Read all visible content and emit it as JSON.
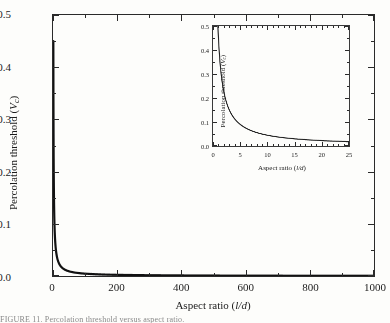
{
  "figure": {
    "caption": "FIGURE 11. Percolation threshold versus aspect ratio."
  },
  "main": {
    "xlabel_prefix": "Aspect ratio (",
    "xlabel_italic": "l/d",
    "xlabel_suffix": ")",
    "ylabel_prefix": "Percolation threshold (",
    "ylabel_italic": "V",
    "ylabel_sub": "c",
    "ylabel_suffix": ")",
    "xticks": [
      "0",
      "200",
      "400",
      "600",
      "800",
      "1000"
    ],
    "yticks": [
      "0.0",
      "0.1",
      "0.2",
      "0.3",
      "0.4",
      "0.5"
    ]
  },
  "inset": {
    "xlabel_prefix": "Aspect ratio (",
    "xlabel_italic": "l/d",
    "xlabel_suffix": ")",
    "ylabel_prefix": "Percolation threshold (",
    "ylabel_italic": "V",
    "ylabel_sub": "c",
    "ylabel_suffix": ")",
    "xticks": [
      "0",
      "5",
      "10",
      "15",
      "20",
      "25"
    ],
    "yticks": [
      "0.0",
      "0.1",
      "0.2",
      "0.3",
      "0.4",
      "0.5"
    ]
  },
  "chart_data": [
    {
      "id": "main",
      "type": "line",
      "title": "",
      "xlabel": "Aspect ratio (l/d)",
      "ylabel": "Percolation threshold (Vc)",
      "xlim": [
        0,
        1000
      ],
      "ylim": [
        0.0,
        0.5
      ],
      "xtick_values": [
        0,
        200,
        400,
        600,
        800,
        1000
      ],
      "ytick_values": [
        0.0,
        0.1,
        0.2,
        0.3,
        0.4,
        0.5
      ],
      "minor_ticks": true,
      "grid": false,
      "legend": "none",
      "line_color": "#111111",
      "line_width": 2.2,
      "series": [
        {
          "name": "Percolation threshold",
          "x": [
            0.8,
            1,
            1.5,
            2,
            2.5,
            3,
            4,
            5,
            6,
            8,
            10,
            12,
            15,
            20,
            25,
            30,
            40,
            50,
            60,
            80,
            100,
            150,
            200,
            300,
            400,
            500,
            600,
            700,
            800,
            900,
            1000
          ],
          "y": [
            0.5,
            0.45,
            0.31,
            0.235,
            0.19,
            0.159,
            0.12,
            0.097,
            0.081,
            0.061,
            0.049,
            0.041,
            0.033,
            0.0249,
            0.02,
            0.0167,
            0.0125,
            0.01,
            0.0084,
            0.0063,
            0.005,
            0.0033,
            0.0025,
            0.0017,
            0.00125,
            0.001,
            0.00084,
            0.00072,
            0.00063,
            0.00056,
            0.0005
          ]
        }
      ]
    },
    {
      "id": "inset",
      "type": "line",
      "title": "",
      "xlabel": "Aspect ratio (l/d)",
      "ylabel": "Percolation threshold (Vc)",
      "xlim": [
        0,
        25
      ],
      "ylim": [
        0.0,
        0.5
      ],
      "xtick_values": [
        0,
        5,
        10,
        15,
        20,
        25
      ],
      "ytick_values": [
        0.0,
        0.1,
        0.2,
        0.3,
        0.4,
        0.5
      ],
      "minor_ticks": true,
      "grid": false,
      "legend": "none",
      "line_color": "#222222",
      "line_width": 1.1,
      "series": [
        {
          "name": "Percolation threshold",
          "x": [
            0.8,
            1,
            1.25,
            1.5,
            1.75,
            2,
            2.5,
            3,
            3.5,
            4,
            5,
            6,
            7,
            8,
            9,
            10,
            11,
            12,
            13,
            14,
            15,
            16,
            17,
            18,
            19,
            20,
            21,
            22,
            23,
            24,
            25
          ],
          "y": [
            0.5,
            0.45,
            0.375,
            0.31,
            0.268,
            0.235,
            0.19,
            0.159,
            0.137,
            0.12,
            0.097,
            0.081,
            0.07,
            0.061,
            0.054,
            0.049,
            0.0446,
            0.041,
            0.0381,
            0.0355,
            0.0333,
            0.0313,
            0.0296,
            0.0281,
            0.0267,
            0.0249,
            0.0236,
            0.0225,
            0.0215,
            0.0207,
            0.02
          ]
        }
      ]
    }
  ]
}
